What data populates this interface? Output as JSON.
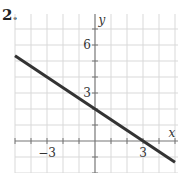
{
  "problem_number": "2.",
  "chart_data": {
    "type": "line",
    "title": "",
    "xlabel": "x",
    "ylabel": "y",
    "xlim": [
      -5,
      5
    ],
    "ylim": [
      -2,
      8
    ],
    "grid": true,
    "grid_step": 1,
    "x_tick_labels": [
      {
        "value": -3,
        "label": "−3"
      },
      {
        "value": 3,
        "label": "3"
      }
    ],
    "y_tick_labels": [
      {
        "value": 3,
        "label": "3"
      },
      {
        "value": 6,
        "label": "6"
      }
    ],
    "series": [
      {
        "name": "line",
        "equation": "y = -2/3 x + 2",
        "x": [
          -5,
          5
        ],
        "y": [
          5.333,
          -1.333
        ],
        "color": "#333333"
      }
    ],
    "key_points": {
      "y_intercept": [
        0,
        2
      ],
      "x_intercept": [
        3,
        0
      ]
    }
  },
  "colors": {
    "grid": "#d9d9d9",
    "axis": "#777777",
    "line": "#333333"
  }
}
